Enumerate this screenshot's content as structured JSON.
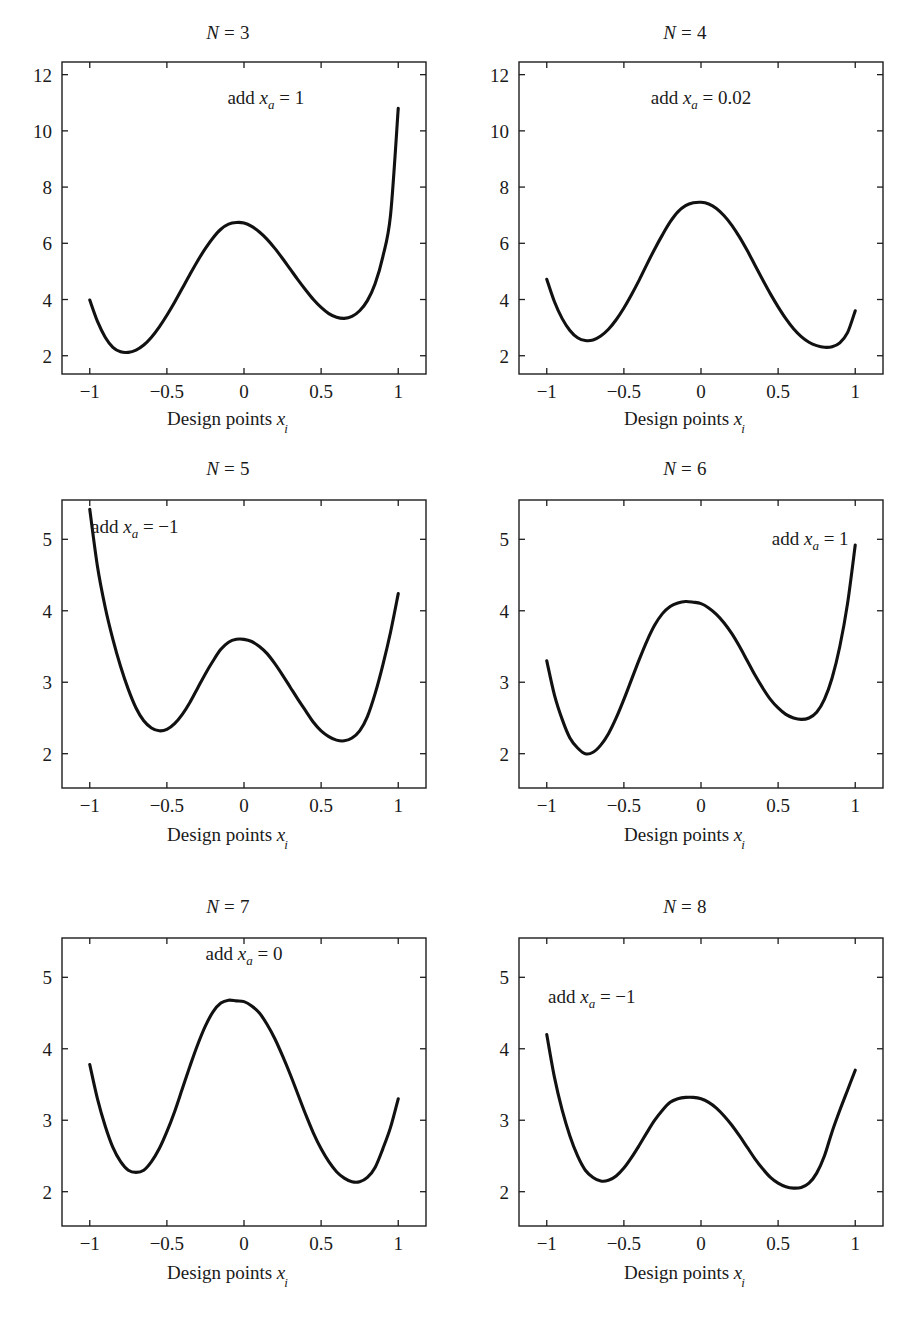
{
  "figure": {
    "x_axis_label": "Design points",
    "x_axis_label_var": "x",
    "x_axis_label_sub": "i",
    "line_color": "#111111",
    "axis_color": "#1d1d1d",
    "background": "#ffffff"
  },
  "chart_data": [
    {
      "type": "line",
      "panel_id": "n3",
      "title": "N = 3",
      "title_var": "N",
      "title_rest": " = 3",
      "annotation": "add x_a = 1",
      "annotation_prefix": "add ",
      "annotation_var": "x",
      "annotation_sub": "a",
      "annotation_value": " = 1",
      "xlabel": "Design points x_i",
      "ylabel": "",
      "xlim": [
        -1.18,
        1.18
      ],
      "ylim": [
        1.35,
        12.45
      ],
      "xticks": [
        -1,
        -0.5,
        0,
        0.5,
        1
      ],
      "xticklabels": [
        "−1",
        "−0.5",
        "0",
        "0.5",
        "1"
      ],
      "yticks": [
        2,
        4,
        6,
        8,
        10,
        12
      ],
      "yticklabels": [
        "2",
        "4",
        "6",
        "8",
        "10",
        "12"
      ],
      "grid": false,
      "legend": "none",
      "x": [
        -1.0,
        -0.95,
        -0.9,
        -0.85,
        -0.8,
        -0.75,
        -0.7,
        -0.65,
        -0.6,
        -0.55,
        -0.5,
        -0.45,
        -0.4,
        -0.35,
        -0.3,
        -0.25,
        -0.2,
        -0.15,
        -0.1,
        -0.05,
        0.0,
        0.05,
        0.1,
        0.15,
        0.2,
        0.25,
        0.3,
        0.35,
        0.4,
        0.45,
        0.5,
        0.55,
        0.6,
        0.65,
        0.7,
        0.75,
        0.8,
        0.85,
        0.9,
        0.95,
        1.0
      ],
      "y": [
        3.98,
        3.22,
        2.66,
        2.3,
        2.14,
        2.12,
        2.2,
        2.38,
        2.66,
        3.02,
        3.44,
        3.9,
        4.4,
        4.9,
        5.38,
        5.82,
        6.2,
        6.5,
        6.68,
        6.74,
        6.72,
        6.6,
        6.4,
        6.14,
        5.82,
        5.46,
        5.08,
        4.7,
        4.34,
        4.0,
        3.72,
        3.5,
        3.37,
        3.33,
        3.4,
        3.6,
        3.96,
        4.56,
        5.52,
        7.0,
        10.8
      ]
    },
    {
      "type": "line",
      "panel_id": "n4",
      "title": "N = 4",
      "title_var": "N",
      "title_rest": " = 4",
      "annotation": "add x_a = 0.02",
      "annotation_prefix": "add ",
      "annotation_var": "x",
      "annotation_sub": "a",
      "annotation_value": " = 0.02",
      "xlabel": "Design points x_i",
      "ylabel": "",
      "xlim": [
        -1.18,
        1.18
      ],
      "ylim": [
        1.35,
        12.45
      ],
      "xticks": [
        -1,
        -0.5,
        0,
        0.5,
        1
      ],
      "xticklabels": [
        "−1",
        "−0.5",
        "0",
        "0.5",
        "1"
      ],
      "yticks": [
        2,
        4,
        6,
        8,
        10,
        12
      ],
      "yticklabels": [
        "2",
        "4",
        "6",
        "8",
        "10",
        "12"
      ],
      "grid": false,
      "legend": "none",
      "x": [
        -1.0,
        -0.95,
        -0.9,
        -0.85,
        -0.8,
        -0.75,
        -0.7,
        -0.65,
        -0.6,
        -0.55,
        -0.5,
        -0.45,
        -0.4,
        -0.35,
        -0.3,
        -0.25,
        -0.2,
        -0.15,
        -0.1,
        -0.05,
        0.0,
        0.05,
        0.1,
        0.15,
        0.2,
        0.25,
        0.3,
        0.35,
        0.4,
        0.45,
        0.5,
        0.55,
        0.6,
        0.65,
        0.7,
        0.75,
        0.8,
        0.85,
        0.9,
        0.95,
        1.0
      ],
      "y": [
        4.72,
        3.92,
        3.32,
        2.9,
        2.64,
        2.54,
        2.56,
        2.7,
        2.94,
        3.28,
        3.7,
        4.18,
        4.7,
        5.26,
        5.8,
        6.3,
        6.76,
        7.12,
        7.34,
        7.44,
        7.46,
        7.4,
        7.24,
        6.98,
        6.64,
        6.22,
        5.74,
        5.22,
        4.7,
        4.2,
        3.74,
        3.32,
        2.96,
        2.68,
        2.48,
        2.36,
        2.3,
        2.32,
        2.46,
        2.82,
        3.6
      ]
    },
    {
      "type": "line",
      "panel_id": "n5",
      "title": "N = 5",
      "title_var": "N",
      "title_rest": " = 5",
      "annotation": "add x_a = −1",
      "annotation_prefix": "add ",
      "annotation_var": "x",
      "annotation_sub": "a",
      "annotation_value": " = −1",
      "xlabel": "Design points x_i",
      "ylabel": "",
      "xlim": [
        -1.18,
        1.18
      ],
      "ylim": [
        1.52,
        5.55
      ],
      "xticks": [
        -1,
        -0.5,
        0,
        0.5,
        1
      ],
      "xticklabels": [
        "−1",
        "−0.5",
        "0",
        "0.5",
        "1"
      ],
      "yticks": [
        2,
        3,
        4,
        5
      ],
      "yticklabels": [
        "2",
        "3",
        "4",
        "5"
      ],
      "grid": false,
      "legend": "none",
      "x": [
        -1.0,
        -0.95,
        -0.9,
        -0.85,
        -0.8,
        -0.75,
        -0.7,
        -0.65,
        -0.6,
        -0.55,
        -0.5,
        -0.45,
        -0.4,
        -0.35,
        -0.3,
        -0.25,
        -0.2,
        -0.15,
        -0.1,
        -0.05,
        0.0,
        0.05,
        0.1,
        0.15,
        0.2,
        0.25,
        0.3,
        0.35,
        0.4,
        0.45,
        0.5,
        0.55,
        0.6,
        0.65,
        0.7,
        0.75,
        0.8,
        0.85,
        0.9,
        0.95,
        1.0
      ],
      "y": [
        5.42,
        4.62,
        4.05,
        3.6,
        3.22,
        2.9,
        2.64,
        2.46,
        2.36,
        2.32,
        2.34,
        2.42,
        2.55,
        2.72,
        2.92,
        3.12,
        3.3,
        3.46,
        3.56,
        3.6,
        3.6,
        3.57,
        3.5,
        3.4,
        3.26,
        3.1,
        2.93,
        2.76,
        2.6,
        2.44,
        2.32,
        2.24,
        2.19,
        2.18,
        2.22,
        2.32,
        2.52,
        2.84,
        3.24,
        3.7,
        4.24
      ]
    },
    {
      "type": "line",
      "panel_id": "n6",
      "title": "N = 6",
      "title_var": "N",
      "title_rest": " = 6",
      "annotation": "add x_a = 1",
      "annotation_prefix": "add ",
      "annotation_var": "x",
      "annotation_sub": "a",
      "annotation_value": " = 1",
      "xlabel": "Design points x_i",
      "ylabel": "",
      "xlim": [
        -1.18,
        1.18
      ],
      "ylim": [
        1.52,
        5.55
      ],
      "xticks": [
        -1,
        -0.5,
        0,
        0.5,
        1
      ],
      "xticklabels": [
        "−1",
        "−0.5",
        "0",
        "0.5",
        "1"
      ],
      "yticks": [
        2,
        3,
        4,
        5
      ],
      "yticklabels": [
        "2",
        "3",
        "4",
        "5"
      ],
      "grid": false,
      "legend": "none",
      "x": [
        -1.0,
        -0.95,
        -0.9,
        -0.85,
        -0.8,
        -0.75,
        -0.7,
        -0.65,
        -0.6,
        -0.55,
        -0.5,
        -0.45,
        -0.4,
        -0.35,
        -0.3,
        -0.25,
        -0.2,
        -0.15,
        -0.1,
        -0.05,
        0.0,
        0.05,
        0.1,
        0.15,
        0.2,
        0.25,
        0.3,
        0.35,
        0.4,
        0.45,
        0.5,
        0.55,
        0.6,
        0.65,
        0.7,
        0.75,
        0.8,
        0.85,
        0.9,
        0.95,
        1.0
      ],
      "y": [
        3.3,
        2.82,
        2.48,
        2.22,
        2.08,
        2.0,
        2.02,
        2.12,
        2.28,
        2.5,
        2.76,
        3.04,
        3.32,
        3.58,
        3.8,
        3.96,
        4.06,
        4.11,
        4.13,
        4.12,
        4.1,
        4.04,
        3.95,
        3.83,
        3.68,
        3.5,
        3.3,
        3.1,
        2.92,
        2.76,
        2.64,
        2.55,
        2.5,
        2.48,
        2.5,
        2.58,
        2.76,
        3.06,
        3.5,
        4.1,
        4.92
      ]
    },
    {
      "type": "line",
      "panel_id": "n7",
      "title": "N = 7",
      "title_var": "N",
      "title_rest": " = 7",
      "annotation": "add x_a = 0",
      "annotation_prefix": "add ",
      "annotation_var": "x",
      "annotation_sub": "a",
      "annotation_value": " = 0",
      "xlabel": "Design points x_i",
      "ylabel": "",
      "xlim": [
        -1.18,
        1.18
      ],
      "ylim": [
        1.52,
        5.55
      ],
      "xticks": [
        -1,
        -0.5,
        0,
        0.5,
        1
      ],
      "xticklabels": [
        "−1",
        "−0.5",
        "0",
        "0.5",
        "1"
      ],
      "yticks": [
        2,
        3,
        4,
        5
      ],
      "yticklabels": [
        "2",
        "3",
        "4",
        "5"
      ],
      "grid": false,
      "legend": "none",
      "x": [
        -1.0,
        -0.95,
        -0.9,
        -0.85,
        -0.8,
        -0.75,
        -0.7,
        -0.65,
        -0.6,
        -0.55,
        -0.5,
        -0.45,
        -0.4,
        -0.35,
        -0.3,
        -0.25,
        -0.2,
        -0.15,
        -0.1,
        -0.05,
        0.0,
        0.05,
        0.1,
        0.15,
        0.2,
        0.25,
        0.3,
        0.35,
        0.4,
        0.45,
        0.5,
        0.55,
        0.6,
        0.65,
        0.7,
        0.75,
        0.8,
        0.85,
        0.9,
        0.95,
        1.0
      ],
      "y": [
        3.78,
        3.3,
        2.92,
        2.62,
        2.42,
        2.3,
        2.27,
        2.3,
        2.42,
        2.6,
        2.84,
        3.12,
        3.44,
        3.76,
        4.06,
        4.32,
        4.52,
        4.64,
        4.68,
        4.67,
        4.66,
        4.6,
        4.5,
        4.34,
        4.14,
        3.9,
        3.64,
        3.36,
        3.08,
        2.82,
        2.6,
        2.42,
        2.28,
        2.19,
        2.14,
        2.14,
        2.2,
        2.34,
        2.6,
        2.9,
        3.3
      ]
    },
    {
      "type": "line",
      "panel_id": "n8",
      "title": "N = 8",
      "title_var": "N",
      "title_rest": " = 8",
      "annotation": "add x_a = −1",
      "annotation_prefix": "add ",
      "annotation_var": "x",
      "annotation_sub": "a",
      "annotation_value": " = −1",
      "xlabel": "Design points x_i",
      "ylabel": "",
      "xlim": [
        -1.18,
        1.18
      ],
      "ylim": [
        1.52,
        5.55
      ],
      "xticks": [
        -1,
        -0.5,
        0,
        0.5,
        1
      ],
      "xticklabels": [
        "−1",
        "−0.5",
        "0",
        "0.5",
        "1"
      ],
      "yticks": [
        2,
        3,
        4,
        5
      ],
      "yticklabels": [
        "2",
        "3",
        "4",
        "5"
      ],
      "grid": false,
      "legend": "none",
      "x": [
        -1.0,
        -0.95,
        -0.9,
        -0.85,
        -0.8,
        -0.75,
        -0.7,
        -0.65,
        -0.6,
        -0.55,
        -0.5,
        -0.45,
        -0.4,
        -0.35,
        -0.3,
        -0.25,
        -0.2,
        -0.15,
        -0.1,
        -0.05,
        0.0,
        0.05,
        0.1,
        0.15,
        0.2,
        0.25,
        0.3,
        0.35,
        0.4,
        0.45,
        0.5,
        0.55,
        0.6,
        0.65,
        0.7,
        0.75,
        0.8,
        0.85,
        0.9,
        0.95,
        1.0
      ],
      "y": [
        4.2,
        3.6,
        3.14,
        2.78,
        2.5,
        2.3,
        2.2,
        2.15,
        2.16,
        2.22,
        2.33,
        2.48,
        2.65,
        2.83,
        3.0,
        3.14,
        3.25,
        3.3,
        3.32,
        3.32,
        3.3,
        3.25,
        3.17,
        3.06,
        2.93,
        2.78,
        2.62,
        2.46,
        2.32,
        2.2,
        2.12,
        2.07,
        2.05,
        2.06,
        2.12,
        2.26,
        2.5,
        2.84,
        3.14,
        3.42,
        3.7
      ]
    }
  ],
  "layout": {
    "panels": [
      {
        "id": "n3",
        "left": 0,
        "top": 22,
        "plot_x": 62,
        "plot_y": 40,
        "plot_w": 364,
        "plot_h": 312,
        "title_top": 0,
        "xlabel_top": 386,
        "annot_x": 0.56,
        "annot_y": 0.865,
        "annot_anchor": "middle"
      },
      {
        "id": "n4",
        "left": 457,
        "top": 22,
        "plot_x": 62,
        "plot_y": 40,
        "plot_w": 364,
        "plot_h": 312,
        "title_top": 0,
        "xlabel_top": 386,
        "annot_x": 0.5,
        "annot_y": 0.865,
        "annot_anchor": "middle"
      },
      {
        "id": "n5",
        "left": 0,
        "top": 452,
        "plot_x": 62,
        "plot_y": 48,
        "plot_w": 364,
        "plot_h": 288,
        "title_top": 6,
        "xlabel_top": 372,
        "annot_x": 0.2,
        "annot_y": 0.885,
        "annot_anchor": "middle"
      },
      {
        "id": "n6",
        "left": 457,
        "top": 452,
        "plot_x": 62,
        "plot_y": 48,
        "plot_w": 364,
        "plot_h": 288,
        "title_top": 6,
        "xlabel_top": 372,
        "annot_x": 0.8,
        "annot_y": 0.845,
        "annot_anchor": "middle"
      },
      {
        "id": "n7",
        "left": 0,
        "top": 890,
        "plot_x": 62,
        "plot_y": 48,
        "plot_w": 364,
        "plot_h": 288,
        "title_top": 6,
        "xlabel_top": 372,
        "annot_x": 0.5,
        "annot_y": 0.925,
        "annot_anchor": "middle"
      },
      {
        "id": "n8",
        "left": 457,
        "top": 890,
        "plot_x": 62,
        "plot_y": 48,
        "plot_w": 364,
        "plot_h": 288,
        "title_top": 6,
        "xlabel_top": 372,
        "annot_x": 0.2,
        "annot_y": 0.775,
        "annot_anchor": "middle"
      }
    ]
  }
}
